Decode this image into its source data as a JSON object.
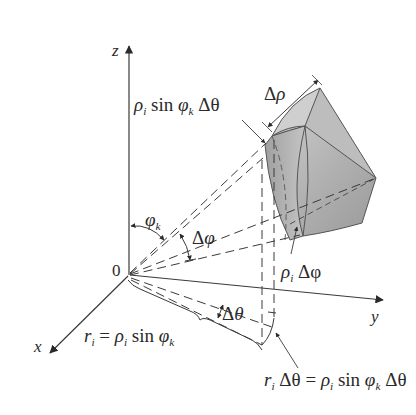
{
  "diagram": {
    "axes": {
      "z": {
        "label": "z"
      },
      "x": {
        "label": "x"
      },
      "y": {
        "label": "y"
      },
      "origin": {
        "label": "0"
      }
    },
    "labels": {
      "top_arc": {
        "rho": "ρ",
        "i": "i",
        "sin": " sin ",
        "phi": "φ",
        "k": "k",
        "dtheta": " Δθ"
      },
      "delta_rho": {
        "delta": "Δ",
        "rho": "ρ"
      },
      "phi_k": {
        "phi": "φ",
        "k": "k"
      },
      "delta_phi": {
        "delta": "Δ",
        "phi": "φ"
      },
      "rho_delta_phi": {
        "rho": "ρ",
        "i": "i",
        "dphi": " Δφ"
      },
      "r_i": {
        "r": "r",
        "i": "i",
        "eq": " = ",
        "rho": "ρ",
        "i2": "i",
        "sin": " sin ",
        "phi": "φ",
        "k": "k"
      },
      "delta_theta": {
        "delta": "Δ",
        "theta": "θ"
      },
      "bottom_arc": {
        "r": "r",
        "i": "i",
        "dtheta": " Δθ = ",
        "rho": "ρ",
        "i2": "i",
        "sin": " sin ",
        "phi": "φ",
        "k": "k",
        "dtheta2": " Δθ"
      }
    },
    "colors": {
      "line": "#3a3a3a",
      "wedge_fill": "#a9a9a9",
      "wedge_light": "#c8c8c8",
      "wedge_dark": "#8f8f8f",
      "background": "#ffffff"
    }
  }
}
